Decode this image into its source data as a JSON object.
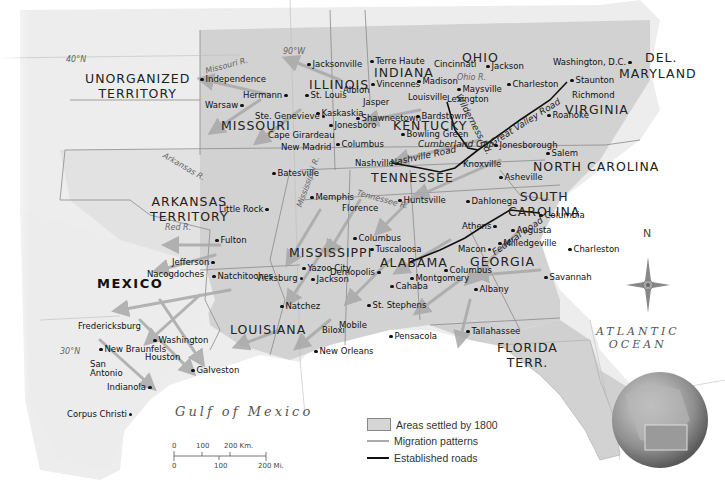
{
  "map": {
    "regions": [
      {
        "name": "UNORGANIZED TERRITORY",
        "line1": "UNORGANIZED",
        "line2": "TERRITORY"
      },
      {
        "name": "ILLINOIS"
      },
      {
        "name": "INDIANA"
      },
      {
        "name": "OHIO"
      },
      {
        "name": "DEL."
      },
      {
        "name": "MARYLAND"
      },
      {
        "name": "VIRGINIA"
      },
      {
        "name": "MISSOURI"
      },
      {
        "name": "KENTUCKY"
      },
      {
        "name": "NORTH CAROLINA"
      },
      {
        "name": "TENNESSEE"
      },
      {
        "name": "ARKANSAS TERRITORY",
        "line1": "ARKANSAS",
        "line2": "TERRITORY"
      },
      {
        "name": "SOUTH CAROLINA",
        "line1": "SOUTH",
        "line2": "CAROLINA"
      },
      {
        "name": "MEXICO"
      },
      {
        "name": "MISSISSIPPI"
      },
      {
        "name": "ALABAMA"
      },
      {
        "name": "GEORGIA"
      },
      {
        "name": "LOUISIANA"
      },
      {
        "name": "FLORIDA TERR.",
        "line1": "FLORIDA",
        "line2": "TERR."
      }
    ],
    "cities": [
      "Jacksonville",
      "Terre Haute",
      "Cincinnati",
      "Jackson",
      "Washington, D.C.",
      "Independence",
      "Hermann",
      "St. Louis",
      "Albion",
      "Vincennes",
      "Madison",
      "Maysville",
      "Charleston",
      "Staunton",
      "Warsaw",
      "Jasper",
      "Louisville",
      "Lexington",
      "Richmond",
      "Ste. Genevieve",
      "Kaskaskia",
      "Shawneetown",
      "Bardstown",
      "Roanoke",
      "Jonesboro",
      "Cape Girardeau",
      "Bowling Green",
      "New Madrid",
      "Columbus",
      "Jonesborough",
      "Salem",
      "Nashville",
      "Knoxville",
      "Batesville",
      "Asheville",
      "Little Rock",
      "Memphis",
      "Florence",
      "Huntsville",
      "Dahlonega",
      "Columbia",
      "Athens",
      "Augusta",
      "Fulton",
      "Milledgeville",
      "Macon",
      "Charleston",
      "Jefferson",
      "Columbus",
      "Tuscaloosa",
      "Yazoo City",
      "Demopolis",
      "Savannah",
      "Natchitoches",
      "Vicksburg",
      "Jackson",
      "Montgomery",
      "Columbus",
      "Nacogdoches",
      "Cahaba",
      "Albany",
      "Natchez",
      "St. Stephens",
      "Fredericksburg",
      "Washington",
      "Mobile",
      "Tallahassee",
      "New Braunfels",
      "Biloxi",
      "Pensacola",
      "Houston",
      "San Antonio",
      "Galveston",
      "New Orleans",
      "Indianola",
      "Corpus Christi"
    ],
    "rivers": [
      "Missouri R.",
      "Ohio R.",
      "Arkansas R.",
      "Mississippi R.",
      "Red R.",
      "Tennessee R."
    ],
    "roads": [
      "Wilderness Rd.",
      "Great Valley Road",
      "Cumberland Gap",
      "Nashville Road",
      "Federal Road"
    ],
    "latitudes": [
      "40°N",
      "30°N"
    ],
    "longitudes": [
      "90°W"
    ],
    "water_bodies": {
      "gulf": "Gulf of Mexico",
      "atlantic_line1": "ATLANTIC",
      "atlantic_line2": "OCEAN"
    },
    "compass": {
      "north": "N"
    }
  },
  "legend": {
    "settled": "Areas settled by 1800",
    "migration": "Migration patterns",
    "roads": "Established roads"
  },
  "scale": {
    "km_ticks": [
      "0",
      "100",
      "200 Km."
    ],
    "mi_ticks": [
      "0",
      "100",
      "200 Mi."
    ]
  }
}
